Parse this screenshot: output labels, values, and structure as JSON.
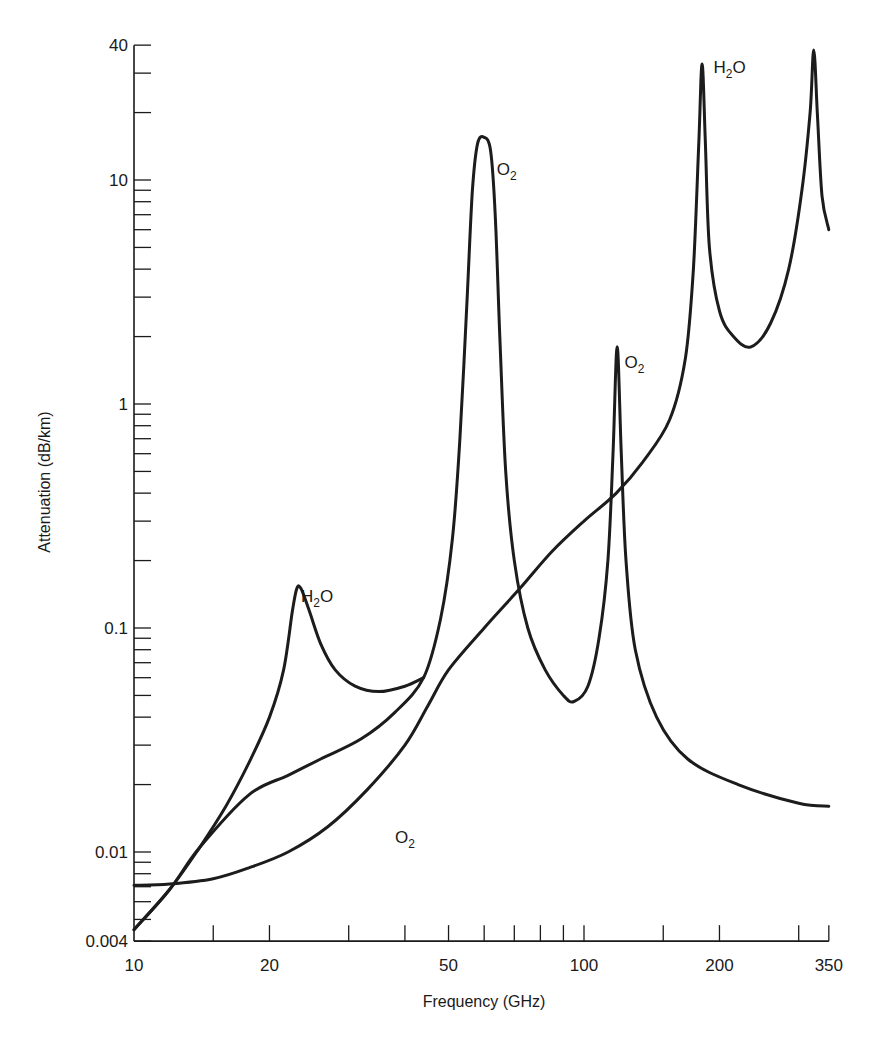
{
  "chart_data": {
    "type": "line",
    "title": "",
    "xlabel": "Frequency (GHz)",
    "ylabel": "Attenuation (dB/km)",
    "xscale": "log",
    "yscale": "log",
    "xlim": [
      10,
      350
    ],
    "ylim": [
      0.004,
      40
    ],
    "grid": false,
    "legend": "none (inline curve labels)",
    "x_tick_labels": [
      "10",
      "20",
      "50",
      "100",
      "200",
      "350"
    ],
    "x_tick_values": [
      10,
      15,
      20,
      30,
      40,
      50,
      60,
      70,
      80,
      90,
      100,
      150,
      200,
      300,
      350
    ],
    "y_tick_labels": [
      "0.004",
      "0.01",
      "0.1",
      "1",
      "10",
      "40"
    ],
    "y_label_values": [
      0.004,
      0.01,
      0.1,
      1,
      10,
      40
    ],
    "annotations": [
      {
        "text": "H",
        "sub": "2",
        "tail": "O",
        "x": 23.5,
        "y": 0.13
      },
      {
        "text": "O",
        "sub": "2",
        "tail": "",
        "x": 38,
        "y": 0.011
      },
      {
        "text": "O",
        "sub": "2",
        "tail": "",
        "x": 64,
        "y": 10.5
      },
      {
        "text": "O",
        "sub": "2",
        "tail": "",
        "x": 123,
        "y": 1.45
      },
      {
        "text": "H",
        "sub": "2",
        "tail": "O",
        "x": 194,
        "y": 30
      }
    ],
    "series": [
      {
        "name": "Oxygen absorption (O2) with H2O 22 GHz continuum segment",
        "points": [
          [
            10,
            0.0045
          ],
          [
            12,
            0.0068
          ],
          [
            14,
            0.0105
          ],
          [
            16,
            0.016
          ],
          [
            18,
            0.025
          ],
          [
            20,
            0.04
          ],
          [
            21.5,
            0.065
          ],
          [
            22.5,
            0.12
          ],
          [
            23,
            0.15
          ],
          [
            23.5,
            0.15
          ],
          [
            24.5,
            0.12
          ],
          [
            26,
            0.085
          ],
          [
            28,
            0.065
          ],
          [
            31,
            0.055
          ],
          [
            35,
            0.052
          ],
          [
            40,
            0.055
          ],
          [
            44,
            0.06
          ]
        ]
      },
      {
        "name": "Oxygen absorption (O2) dry curve",
        "points": [
          [
            10,
            0.0045
          ],
          [
            12,
            0.0068
          ],
          [
            14,
            0.0105
          ],
          [
            18,
            0.018
          ],
          [
            22,
            0.022
          ],
          [
            26,
            0.026
          ],
          [
            32,
            0.032
          ],
          [
            38,
            0.042
          ],
          [
            44,
            0.06
          ],
          [
            48,
            0.11
          ],
          [
            51,
            0.25
          ],
          [
            53,
            0.7
          ],
          [
            55,
            3.0
          ],
          [
            56.5,
            9.0
          ],
          [
            58,
            14.5
          ],
          [
            60,
            15.5
          ],
          [
            62,
            13.5
          ],
          [
            63.5,
            7.0
          ],
          [
            65,
            2.0
          ],
          [
            67,
            0.5
          ],
          [
            70,
            0.2
          ],
          [
            75,
            0.1
          ],
          [
            82,
            0.065
          ],
          [
            90,
            0.05
          ],
          [
            95,
            0.047
          ],
          [
            102,
            0.055
          ],
          [
            108,
            0.09
          ],
          [
            113,
            0.2
          ],
          [
            116,
            0.6
          ],
          [
            118.5,
            1.8
          ],
          [
            121,
            0.6
          ],
          [
            124,
            0.2
          ],
          [
            130,
            0.08
          ],
          [
            145,
            0.04
          ],
          [
            170,
            0.026
          ],
          [
            220,
            0.02
          ],
          [
            300,
            0.0165
          ],
          [
            350,
            0.016
          ]
        ]
      },
      {
        "name": "Water vapor (H2O)",
        "points": [
          [
            10,
            0.0071
          ],
          [
            12,
            0.0072
          ],
          [
            15,
            0.0076
          ],
          [
            18,
            0.0085
          ],
          [
            22,
            0.01
          ],
          [
            27,
            0.013
          ],
          [
            33,
            0.019
          ],
          [
            40,
            0.03
          ],
          [
            45,
            0.045
          ],
          [
            50,
            0.065
          ],
          [
            60,
            0.1
          ],
          [
            72,
            0.15
          ],
          [
            85,
            0.22
          ],
          [
            100,
            0.3
          ],
          [
            118,
            0.4
          ],
          [
            135,
            0.55
          ],
          [
            155,
            0.85
          ],
          [
            168,
            1.6
          ],
          [
            175,
            4.0
          ],
          [
            180,
            15
          ],
          [
            183,
            33
          ],
          [
            186,
            15
          ],
          [
            190,
            5.0
          ],
          [
            200,
            2.6
          ],
          [
            215,
            2.0
          ],
          [
            235,
            1.8
          ],
          [
            260,
            2.3
          ],
          [
            285,
            4.0
          ],
          [
            305,
            9.0
          ],
          [
            318,
            20
          ],
          [
            324,
            38
          ],
          [
            330,
            20
          ],
          [
            338,
            8.5
          ],
          [
            350,
            6.0
          ]
        ]
      }
    ]
  }
}
